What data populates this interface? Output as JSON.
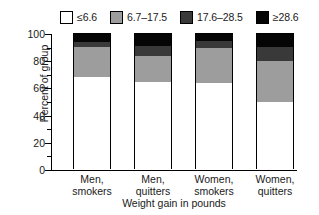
{
  "chart_data": {
    "type": "bar",
    "subtype": "stacked-bar-100-percent",
    "title": "",
    "xlabel": "Weight gain in pounds",
    "ylabel": "Percent of group",
    "ylim": [
      0,
      100
    ],
    "ytick_labels": [
      "0",
      "20",
      "40",
      "60",
      "80",
      "100"
    ],
    "ytick_values": [
      0,
      20,
      40,
      60,
      80,
      100
    ],
    "yminor_tick_values": [
      10,
      30,
      50,
      70,
      90
    ],
    "grid": false,
    "legend_position": "top",
    "categories": [
      "Men, smokers",
      "Men, quitters",
      "Women, smokers",
      "Women, quitters"
    ],
    "category_lines": [
      [
        "Men,",
        "smokers"
      ],
      [
        "Men,",
        "quitters"
      ],
      [
        "Women,",
        "smokers"
      ],
      [
        "Women,",
        "quitters"
      ]
    ],
    "series": [
      {
        "name": "≤6.6",
        "color": "#ffffff",
        "values": [
          67.6,
          64.0,
          63.2,
          49.3
        ]
      },
      {
        "name": "6.7–17.5",
        "color": "#9d9d9d",
        "values": [
          22.1,
          19.1,
          25.7,
          30.1
        ]
      },
      {
        "name": "17.6–28.5",
        "color": "#393939",
        "values": [
          3.7,
          7.4,
          5.2,
          10.3
        ]
      },
      {
        "name": "≥28.6",
        "color": "#050505",
        "values": [
          6.6,
          9.5,
          5.9,
          10.3
        ]
      }
    ]
  },
  "legend": {
    "entries": [
      {
        "label": "≤6.6"
      },
      {
        "label": "6.7–17.5"
      },
      {
        "label": "17.6–28.5"
      },
      {
        "label": "≥28.6"
      }
    ]
  },
  "colors": {
    "series1": "#ffffff",
    "series2": "#9d9d9d",
    "series3": "#393939",
    "series4": "#050505",
    "axis": "#000000",
    "text": "#1a1a1a",
    "background": "#ffffff"
  }
}
